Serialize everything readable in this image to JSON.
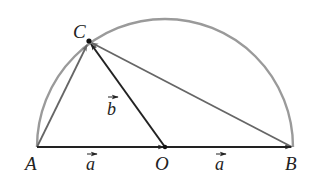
{
  "diagram": {
    "type": "geometry",
    "points": {
      "A": {
        "label": "A",
        "x": 37,
        "y": 147
      },
      "O": {
        "label": "O",
        "x": 165,
        "y": 147
      },
      "B": {
        "label": "B",
        "x": 292,
        "y": 147
      },
      "C": {
        "label": "C",
        "x": 89,
        "y": 41
      }
    },
    "vector_labels": {
      "AO": "a",
      "OB": "a",
      "OC": "b"
    },
    "segments": [
      {
        "from": "A",
        "to": "O",
        "style": "arrow",
        "color": "#222222"
      },
      {
        "from": "O",
        "to": "B",
        "style": "arrow",
        "color": "#222222"
      },
      {
        "from": "O",
        "to": "C",
        "style": "arrow",
        "color": "#222222"
      },
      {
        "from": "A",
        "to": "C",
        "style": "arrow",
        "color": "#666666"
      },
      {
        "from": "B",
        "to": "C",
        "style": "arrow",
        "color": "#666666"
      }
    ],
    "arc": {
      "center": "O",
      "radius": 128,
      "color": "#9a9a9a"
    },
    "colors": {
      "primary_line": "#222222",
      "secondary_line": "#666666",
      "arc": "#9a9a9a"
    }
  }
}
